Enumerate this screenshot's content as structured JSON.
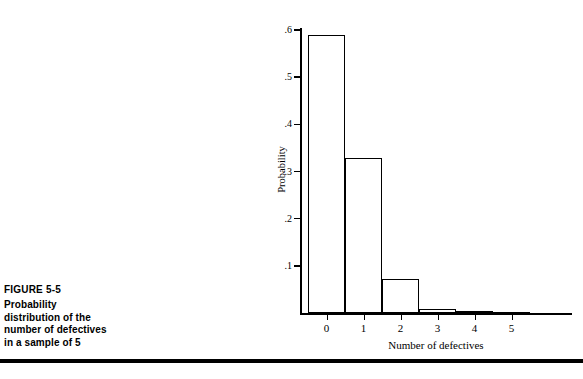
{
  "figure": {
    "number_label": "FIGURE 5-5",
    "caption_lines": [
      "Probability",
      "distribution of the",
      "number of defectives",
      "in a sample of 5"
    ]
  },
  "chart_data": {
    "type": "bar",
    "title": "",
    "xlabel": "Number of defectives",
    "ylabel": "Probability",
    "categories": [
      "0",
      "1",
      "2",
      "3",
      "4",
      "5"
    ],
    "values": [
      0.59,
      0.328,
      0.073,
      0.008,
      0.0045,
      0.002
    ],
    "ylim": [
      0,
      0.6
    ],
    "ytick_labels": [
      ".6",
      ".5",
      ".4",
      ".3",
      ".2",
      ".1"
    ],
    "ytick_values": [
      0.6,
      0.5,
      0.4,
      0.3,
      0.2,
      0.1
    ],
    "xtick_labels": [
      "0",
      "1",
      "2",
      "3",
      "4",
      "5"
    ],
    "grid": false,
    "legend": "none",
    "bar_style": "histogram-adjacent-unfilled",
    "bar_fill_color": "#ffffff",
    "bar_line_color": "#000000"
  },
  "colors": {
    "ink": "#000000",
    "page": "#ffffff"
  }
}
